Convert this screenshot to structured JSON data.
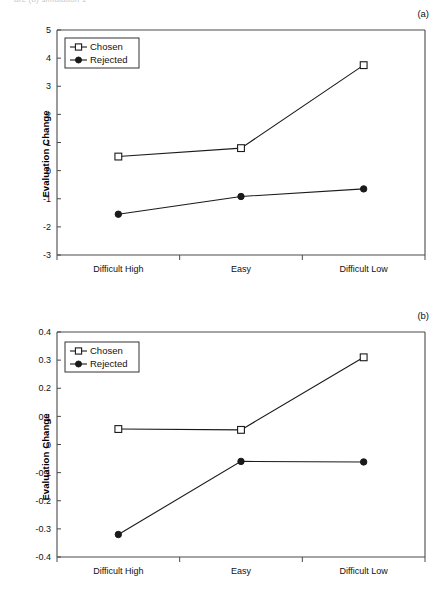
{
  "page": {
    "header_fragment": "are (b) simulation 1"
  },
  "panels": [
    {
      "tag": "(a)",
      "name": "panel-a"
    },
    {
      "tag": "(b)",
      "name": "panel-b"
    }
  ],
  "legend": {
    "chosen_label": "Chosen",
    "rejected_label": "Rejected",
    "chosen_marker": "open-square-marker",
    "rejected_marker": "filled-circle-marker"
  },
  "chart_data": [
    {
      "type": "line",
      "panel": "(a)",
      "title": "",
      "xlabel": "",
      "ylabel": "Evaluation Change",
      "categories": [
        "Difficult High",
        "Easy",
        "Difficult Low"
      ],
      "ylim": [
        -3,
        5
      ],
      "yticks": [
        -3,
        -2,
        -1,
        0,
        1,
        2,
        3,
        4,
        5
      ],
      "ytick_labels": [
        "-3",
        "-2",
        "-1",
        "0",
        "1",
        "2",
        "3",
        "4",
        "5"
      ],
      "grid": false,
      "legend_position": "top-left-inside",
      "series": [
        {
          "name": "Chosen",
          "marker": "open-square",
          "values": [
            0.5,
            0.8,
            3.75
          ]
        },
        {
          "name": "Rejected",
          "marker": "filled-circle",
          "values": [
            -1.55,
            -0.92,
            -0.65
          ]
        }
      ]
    },
    {
      "type": "line",
      "panel": "(b)",
      "title": "",
      "xlabel": "",
      "ylabel": "Evaluation Change",
      "categories": [
        "Difficult High",
        "Easy",
        "Difficult Low"
      ],
      "ylim": [
        -0.4,
        0.4
      ],
      "yticks": [
        -0.4,
        -0.3,
        -0.2,
        -0.1,
        0,
        0.1,
        0.2,
        0.3,
        0.4
      ],
      "ytick_labels": [
        "-0.4",
        "-0.3",
        "-0.2",
        "-0.1",
        "0",
        "0.1",
        "0.2",
        "0.3",
        "0.4"
      ],
      "grid": false,
      "legend_position": "top-left-inside",
      "series": [
        {
          "name": "Chosen",
          "marker": "open-square",
          "values": [
            0.055,
            0.052,
            0.31
          ]
        },
        {
          "name": "Rejected",
          "marker": "filled-circle",
          "values": [
            -0.32,
            -0.06,
            -0.062
          ]
        }
      ]
    }
  ]
}
